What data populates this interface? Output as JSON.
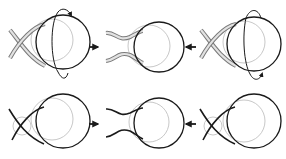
{
  "diagram": {
    "title": "",
    "layout": {
      "rows": 2,
      "columns": 3
    },
    "colors": {
      "outline": "#1a1a1a",
      "tube_fill": "#cfcfcf",
      "tube_edge": "#7a7a7a",
      "faint_circle": "#c8c8c8",
      "background": "#ffffff"
    },
    "rows": [
      {
        "name": "top-row",
        "strand_style": "tube",
        "panels": [
          {
            "name": "panel-1",
            "strands": "crossed",
            "rotation_arrow": "top",
            "label": ""
          },
          {
            "name": "panel-2",
            "strands": "separated",
            "rotation_arrow": "none",
            "label": ""
          },
          {
            "name": "panel-3",
            "strands": "crossed",
            "rotation_arrow": "bottom",
            "label": ""
          }
        ],
        "arrows": [
          {
            "name": "arrow-right",
            "direction": "right"
          },
          {
            "name": "arrow-left",
            "direction": "left"
          }
        ]
      },
      {
        "name": "bottom-row",
        "strand_style": "line",
        "panels": [
          {
            "name": "panel-4",
            "strands": "crossed",
            "rotation_arrow": "none",
            "label": ""
          },
          {
            "name": "panel-5",
            "strands": "separated",
            "rotation_arrow": "none",
            "label": ""
          },
          {
            "name": "panel-6",
            "strands": "crossed",
            "rotation_arrow": "none",
            "label": ""
          }
        ],
        "arrows": [
          {
            "name": "arrow-right",
            "direction": "right"
          },
          {
            "name": "arrow-left",
            "direction": "left"
          }
        ]
      }
    ]
  }
}
